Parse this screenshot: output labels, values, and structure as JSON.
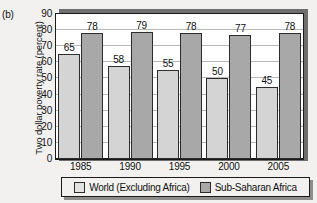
{
  "panel_label": "(b)",
  "colors": {
    "series_world": "#d4d4d4",
    "series_ssa": "#a8a8a8",
    "axis": "#1a1a1a",
    "gridline": "#b9b9b9",
    "background": "#f2f1ef",
    "plot_background": "#ffffff"
  },
  "chart_data": {
    "type": "bar",
    "title": "",
    "xlabel": "",
    "ylabel": "Two dollar poverty rate (percent)",
    "categories": [
      "1985",
      "1990",
      "1995",
      "2000",
      "2005"
    ],
    "ylim": [
      0,
      90
    ],
    "yticks": [
      0,
      10,
      20,
      30,
      40,
      50,
      60,
      70,
      80,
      90
    ],
    "ytick_labels": [
      "0",
      "10",
      "20",
      "30",
      "40",
      "50",
      "60",
      "70",
      "80",
      "90"
    ],
    "grid": true,
    "legend_position": "bottom",
    "series": [
      {
        "name": "World (Excluding Africa)",
        "values": [
          65,
          58,
          55,
          50,
          45
        ],
        "color": "#d4d4d4"
      },
      {
        "name": "Sub-Saharan Africa",
        "values": [
          78,
          79,
          78,
          77,
          78
        ],
        "color": "#a8a8a8"
      }
    ]
  }
}
